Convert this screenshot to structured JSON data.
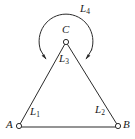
{
  "figure": {
    "background_color": "#ffffff",
    "stroke_color": "#2b2b2b",
    "vertices": [
      {
        "id": "A",
        "label": "A",
        "x": 19,
        "y": 126,
        "label_x": 6,
        "label_y": 120
      },
      {
        "id": "B",
        "label": "B",
        "x": 118,
        "y": 126,
        "label_x": 123,
        "label_y": 120
      },
      {
        "id": "C",
        "label": "C",
        "x": 66,
        "y": 42,
        "label_x": 61,
        "label_y": 25
      }
    ],
    "segments": [
      {
        "id": "L1",
        "label": "L",
        "sub": "1",
        "from": "A",
        "to": "C",
        "label_x": 30,
        "label_y": 107
      },
      {
        "id": "L2",
        "label": "L",
        "sub": "2",
        "from": "C",
        "to": "B",
        "label_x": 95,
        "label_y": 105
      },
      {
        "id": "L3",
        "label": "L",
        "sub": "3",
        "from": "A",
        "to": "B",
        "label_x": 60,
        "label_y": 54
      },
      {
        "id": "L4",
        "label": "L",
        "sub": "4",
        "from": "arc-left",
        "to": "arc-right",
        "label_x": 80,
        "label_y": 4
      }
    ],
    "arc": {
      "name": "L4",
      "description": "semicircular arc above C with arrowheads at both ends",
      "center_x": 66,
      "center_y": 40,
      "radius": 27,
      "arrowheads": 2
    },
    "baseline": {
      "from_x": 19,
      "from_y": 127,
      "to_x": 118,
      "to_y": 127
    }
  }
}
